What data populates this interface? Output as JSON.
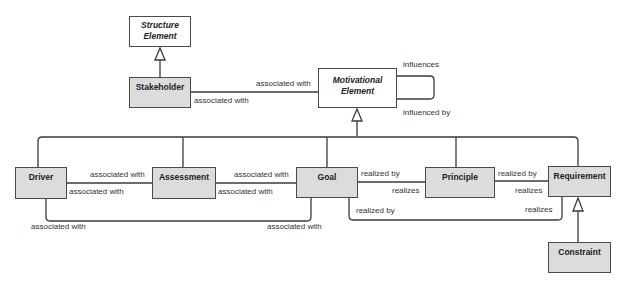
{
  "diagram": {
    "colors": {
      "concrete_fill": "#dcdcdc",
      "abstract_fill": "#ffffff",
      "stroke": "#4a4a4a"
    },
    "nodes": {
      "structure_element": {
        "label_line1": "Structure",
        "label_line2": "Element",
        "abstract": true
      },
      "stakeholder": {
        "label": "Stakeholder"
      },
      "motivational_element": {
        "label_line1": "Motivational",
        "label_line2": "Element",
        "abstract": true
      },
      "driver": {
        "label": "Driver"
      },
      "assessment": {
        "label": "Assessment"
      },
      "goal": {
        "label": "Goal"
      },
      "principle": {
        "label": "Principle"
      },
      "requirement": {
        "label": "Requirement"
      },
      "constraint": {
        "label": "Constraint"
      }
    },
    "edges": {
      "stakeholder_motivational_top": "associated with",
      "stakeholder_motivational_bottom": "associated with",
      "self_loop_top": "influences",
      "self_loop_bottom": "influenced by",
      "driver_assessment_top": "associated with",
      "driver_assessment_bottom": "associated with",
      "assessment_goal_top": "associated with",
      "assessment_goal_bottom": "associated with",
      "driver_goal_left": "associated with",
      "driver_goal_right": "associated with",
      "goal_principle_top": "realized by",
      "goal_principle_bottom": "realizes",
      "principle_requirement_top": "realized by",
      "principle_requirement_bottom": "realizes",
      "goal_requirement_left": "realized by",
      "goal_requirement_right": "realizes"
    }
  }
}
